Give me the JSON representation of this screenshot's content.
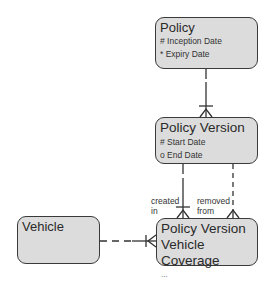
{
  "diagram": {
    "type": "entity-relationship",
    "entities": [
      {
        "id": "policy",
        "title": "Policy",
        "attributes": [
          "# Inception Date",
          "* Expiry Date"
        ]
      },
      {
        "id": "policy_version",
        "title": "Policy Version",
        "attributes": [
          "# Start Date",
          "o End Date"
        ]
      },
      {
        "id": "pvvc",
        "title_lines": [
          "Policy Version",
          "Vehicle Coverage"
        ],
        "more": "..."
      },
      {
        "id": "vehicle",
        "title": "Vehicle",
        "attributes": []
      }
    ],
    "relationships": [
      {
        "from": "policy",
        "to": "policy_version",
        "from_card": "one",
        "to_card": "many",
        "line": "solid"
      },
      {
        "from": "policy_version",
        "to": "pvvc",
        "label": [
          "created",
          "in"
        ],
        "from_card": "one",
        "to_card": "many",
        "line": "solid"
      },
      {
        "from": "policy_version",
        "to": "pvvc",
        "label": [
          "removed",
          "from"
        ],
        "to_card": "many",
        "line": "dashed"
      },
      {
        "from": "vehicle",
        "to": "pvvc",
        "to_card": "one-or-many",
        "line": "dashed-to-solid"
      }
    ],
    "colors": {
      "entity_fill": "#dcdcdc",
      "border": "#3a3a3a",
      "line": "#333333"
    }
  }
}
